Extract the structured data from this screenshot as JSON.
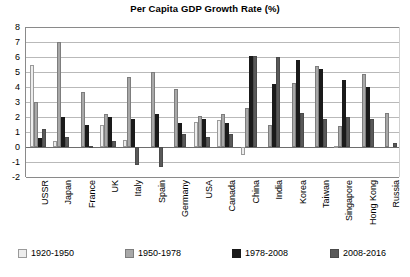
{
  "chart_data": {
    "type": "bar",
    "title": "Per Capita GDP Growth Rate (%)",
    "xlabel": "",
    "ylabel": "",
    "ylim": [
      -2,
      8
    ],
    "ytick_step": 1,
    "yticks": [
      "8",
      "7",
      "6",
      "5",
      "4",
      "3",
      "2",
      "1",
      "0",
      "-1",
      "-2"
    ],
    "grid": true,
    "legend_position": "bottom",
    "categories": [
      "USSR",
      "Japan",
      "France",
      "UK",
      "Italy",
      "Spain",
      "Germany",
      "USA",
      "Canada",
      "China",
      "India",
      "Korea",
      "Taiwan",
      "Singapore",
      "Hong Kong",
      "Russia"
    ],
    "series": [
      {
        "name": "1920-1950",
        "color": "#ededed",
        "values": [
          5.5,
          0.4,
          0.0,
          1.5,
          0.5,
          0.0,
          0.0,
          1.7,
          1.8,
          -0.5,
          0.0,
          0.0,
          0.0,
          0.1,
          0.0,
          0.0
        ]
      },
      {
        "name": "1950-1978",
        "color": "#a8a8a8",
        "values": [
          3.0,
          7.0,
          3.7,
          2.2,
          4.7,
          5.0,
          3.9,
          2.1,
          2.2,
          2.6,
          1.5,
          4.3,
          5.4,
          1.4,
          4.9,
          2.3
        ]
      },
      {
        "name": "1978-2008",
        "color": "#1a1a1a",
        "values": [
          0.6,
          2.0,
          1.5,
          2.0,
          1.9,
          2.2,
          1.6,
          1.9,
          1.6,
          6.1,
          4.2,
          5.8,
          5.2,
          4.5,
          4.0,
          0.0
        ]
      },
      {
        "name": "2008-2016",
        "color": "#595959",
        "values": [
          1.2,
          0.7,
          0.1,
          0.4,
          -1.2,
          -1.3,
          0.9,
          0.7,
          0.9,
          6.1,
          6.0,
          2.3,
          1.9,
          2.0,
          1.9,
          0.3
        ]
      }
    ]
  },
  "legend": {
    "items": [
      {
        "label": "1920-1950",
        "color": "#ededed"
      },
      {
        "label": "1950-1978",
        "color": "#a8a8a8"
      },
      {
        "label": "1978-2008",
        "color": "#1a1a1a"
      },
      {
        "label": "2008-2016",
        "color": "#595959"
      }
    ]
  }
}
